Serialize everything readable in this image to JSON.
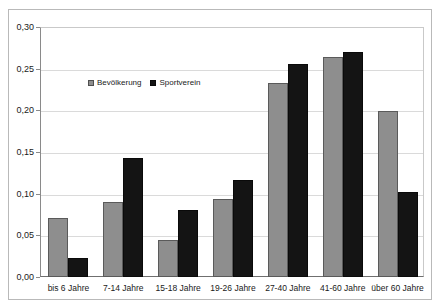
{
  "chart_data": {
    "type": "bar",
    "title": "",
    "subtitle": "",
    "xlabel": "",
    "ylabel": "",
    "ylim": [
      0,
      0.3
    ],
    "y_ticks": [
      "0,00",
      "0,05",
      "0,10",
      "0,15",
      "0,20",
      "0,25",
      "0,30"
    ],
    "y_tick_values": [
      0.0,
      0.05,
      0.1,
      0.15,
      0.2,
      0.25,
      0.3
    ],
    "grid": true,
    "legend_position": "inside-upper-left",
    "categories": [
      "bis 6 Jahre",
      "7-14 Jahre",
      "15-18 Jahre",
      "19-26 Jahre",
      "27-40 Jahre",
      "41-60 Jahre",
      "über 60 Jahre"
    ],
    "series": [
      {
        "name": "Bevölkerung",
        "color": "#8e8e8e",
        "values": [
          0.071,
          0.09,
          0.044,
          0.094,
          0.233,
          0.264,
          0.199
        ]
      },
      {
        "name": "Sportverein",
        "color": "#141414",
        "values": [
          0.023,
          0.143,
          0.08,
          0.117,
          0.256,
          0.27,
          0.102
        ]
      }
    ]
  },
  "legend": {
    "items": [
      {
        "label": "Bevölkerung",
        "marker": "legend-swatch-population"
      },
      {
        "label": "Sportverein",
        "marker": "legend-swatch-sportsclub"
      }
    ]
  },
  "colors": {
    "population_bar": "#8e8e8e",
    "sportsclub_bar": "#141414",
    "gridline": "#dadada",
    "axis": "#6f6f6f",
    "frame": "#b9b9b9",
    "text": "#1a1a1a",
    "background": "#ffffff"
  }
}
